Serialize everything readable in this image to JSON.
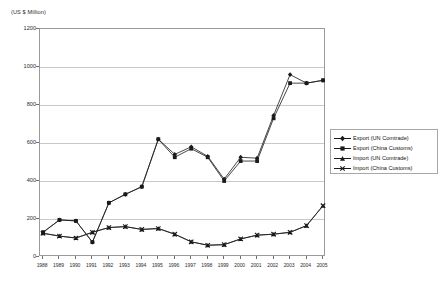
{
  "chart_data": {
    "type": "line",
    "title": "",
    "unit_label": "(US $ Million)",
    "xlabel": "",
    "ylabel": "",
    "ylim": [
      0,
      1200
    ],
    "yticks": [
      0,
      200,
      400,
      600,
      800,
      1000,
      1200
    ],
    "grid": true,
    "legend_position": "right",
    "categories": [
      "1988",
      "1989",
      "1990",
      "1991",
      "1992",
      "1993",
      "1994",
      "1995",
      "1996",
      "1997",
      "1998",
      "1999",
      "2000",
      "2001",
      "2002",
      "2003",
      "2004",
      "2005"
    ],
    "series": [
      {
        "name": "Export (UN Comtrade)",
        "marker": "diamond",
        "color": "#1a1a1a",
        "values": [
          130,
          195,
          190,
          78,
          285,
          330,
          370,
          620,
          540,
          580,
          530,
          410,
          525,
          520,
          745,
          960,
          915,
          930
        ]
      },
      {
        "name": "Export (China Customs)",
        "marker": "square",
        "color": "#1a1a1a",
        "values": [
          130,
          195,
          190,
          78,
          285,
          330,
          370,
          620,
          525,
          570,
          525,
          400,
          505,
          505,
          730,
          915,
          915,
          930
        ]
      },
      {
        "name": "Import (UN Comtrade)",
        "marker": "triangle",
        "color": "#1a1a1a",
        "values": [
          125,
          110,
          100,
          130,
          155,
          160,
          145,
          150,
          120,
          80,
          62,
          65,
          95,
          115,
          120,
          130,
          165,
          270
        ]
      },
      {
        "name": "Import (China Customs)",
        "marker": "cross",
        "color": "#1a1a1a",
        "values": [
          125,
          110,
          100,
          130,
          155,
          160,
          145,
          150,
          120,
          80,
          62,
          65,
          95,
          115,
          120,
          130,
          165,
          270
        ]
      }
    ]
  },
  "legend": {
    "items": [
      {
        "label": "Export (UN Comtrade)"
      },
      {
        "label": "Export (China Customs)"
      },
      {
        "label": "Import (UN Comtrade)"
      },
      {
        "label": "Import (China Customs)"
      }
    ]
  }
}
